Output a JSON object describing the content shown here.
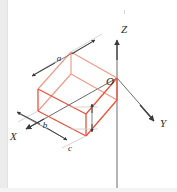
{
  "figure": {
    "type": "isometric-cuboid-with-axes",
    "colors": {
      "box_edge": "#e8533a",
      "box_edge_light": "#f08a72",
      "axis": "#58585a",
      "label_text": "#2b2b2b",
      "background": "#ffffff",
      "gutter": "#ececed"
    },
    "axes": [
      {
        "name": "z-axis",
        "label": "Z",
        "direction": "up",
        "label_x": 121,
        "label_y": 32
      },
      {
        "name": "y-axis",
        "label": "Y",
        "direction": "down-right",
        "label_x": 161,
        "label_y": 124
      },
      {
        "name": "x-axis",
        "label": "X",
        "direction": "down-left",
        "label_x": 13,
        "label_y": 137
      }
    ],
    "origin": {
      "label": "O",
      "label_x": 108,
      "label_y": 81
    },
    "dimensions": [
      {
        "name": "dimension-a",
        "label": "a",
        "edge": "top-left-long-edge",
        "label_x": 59,
        "label_y": 61
      },
      {
        "name": "dimension-b",
        "label": "b",
        "edge": "lower-left-short-edge",
        "label_x": 46,
        "label_y": 127
      },
      {
        "name": "dimension-c",
        "label": "c",
        "edge": "vertical-height-edge",
        "label_x": 70,
        "label_y": 150
      }
    ]
  }
}
